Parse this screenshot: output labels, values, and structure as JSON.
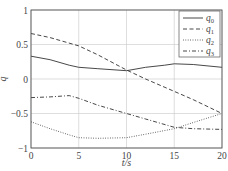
{
  "chart_data": {
    "type": "line",
    "title": "",
    "xlabel": "t/s",
    "ylabel": "q",
    "xlim": [
      0,
      20
    ],
    "ylim": [
      -1,
      1
    ],
    "grid": true,
    "legend_position": "upper right",
    "x_ticks": [
      0,
      5,
      10,
      15,
      20
    ],
    "x_tick_labels": [
      "0",
      "5",
      "10",
      "15",
      "20"
    ],
    "y_ticks": [
      1,
      0.5,
      0,
      -0.5,
      -1
    ],
    "y_tick_labels": [
      "1",
      "0.5",
      "0",
      "−0.5",
      "−1"
    ],
    "series": [
      {
        "name": "q0",
        "label_base": "q",
        "label_sub": "0",
        "style": "solid",
        "x": [
          0,
          2,
          4,
          5,
          7,
          10,
          12,
          14,
          15,
          17,
          20
        ],
        "values": [
          0.33,
          0.28,
          0.2,
          0.17,
          0.15,
          0.12,
          0.17,
          0.2,
          0.22,
          0.21,
          0.17
        ]
      },
      {
        "name": "q1",
        "label_base": "q",
        "label_sub": "1",
        "style": "dashed",
        "x": [
          0,
          2,
          5,
          7,
          10,
          12,
          15,
          17,
          20
        ],
        "values": [
          0.66,
          0.6,
          0.48,
          0.35,
          0.13,
          0.0,
          -0.18,
          -0.3,
          -0.5
        ]
      },
      {
        "name": "q2",
        "label_base": "q",
        "label_sub": "2",
        "style": "dotted",
        "x": [
          0,
          2,
          4,
          5,
          7,
          10,
          12,
          15,
          17,
          20
        ],
        "values": [
          -0.62,
          -0.72,
          -0.81,
          -0.85,
          -0.86,
          -0.85,
          -0.8,
          -0.72,
          -0.63,
          -0.5
        ]
      },
      {
        "name": "q3",
        "label_base": "q",
        "label_sub": "3",
        "style": "dashdot",
        "x": [
          0,
          2,
          4,
          5,
          7,
          10,
          12,
          15,
          17,
          20
        ],
        "values": [
          -0.27,
          -0.26,
          -0.24,
          -0.28,
          -0.38,
          -0.5,
          -0.58,
          -0.7,
          -0.72,
          -0.73
        ]
      }
    ]
  },
  "colors": {
    "line": "#333333",
    "grid": "#c8c8c8",
    "axis": "#555555"
  }
}
